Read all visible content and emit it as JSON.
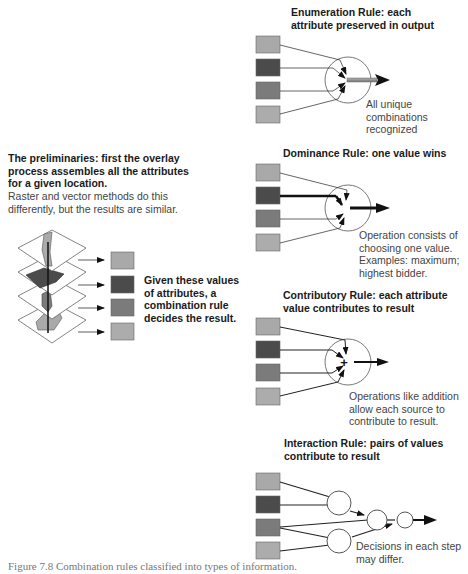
{
  "left_panel": {
    "heading_lines": [
      "The preliminaries: first the overlay",
      "process assembles all the attributes",
      "for a given location."
    ],
    "body_lines": [
      "Raster and vector methods do this",
      "differently, but the results are similar."
    ],
    "note_lines": [
      "Given these values",
      "of attributes, a",
      "combination rule",
      "decides the result."
    ]
  },
  "panels": [
    {
      "id": "enumeration",
      "title_lines": [
        "Enumeration Rule: each",
        "attribute preserved in output"
      ],
      "note_lines": [
        "All unique",
        "combinations",
        "recognized"
      ]
    },
    {
      "id": "dominance",
      "title_lines": [
        "Dominance Rule: one value wins"
      ],
      "note_lines": [
        "Operation consists of",
        "choosing one value.",
        "Examples: maximum;",
        "highest bidder."
      ]
    },
    {
      "id": "contributory",
      "title_lines": [
        "Contributory Rule: each attribute",
        "value contributes to result"
      ],
      "operator_symbol": "+",
      "note_lines": [
        "Operations like addition",
        "allow each source to",
        "contribute to result."
      ]
    },
    {
      "id": "interaction",
      "title_lines": [
        "Interaction Rule: pairs of values",
        "contribute to result"
      ],
      "note_lines": [
        "Decisions in each step",
        "may differ."
      ]
    }
  ],
  "attribute_colors": [
    "#a9a9a9",
    "#4b4b4b",
    "#7b7b7b",
    "#acacac"
  ],
  "caption": "Figure 7.8   Combination rules classified into types of information."
}
